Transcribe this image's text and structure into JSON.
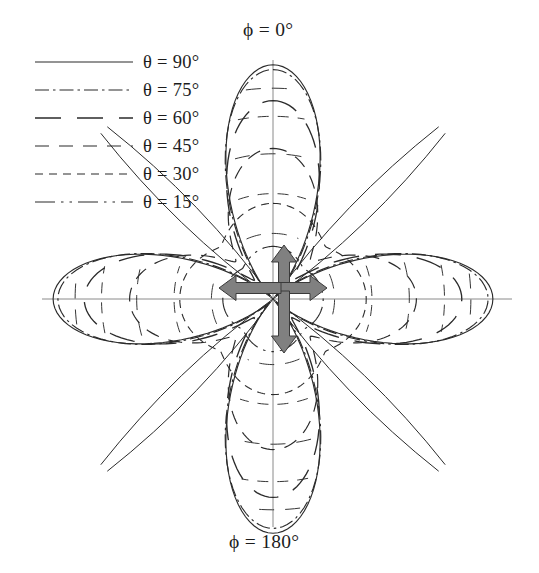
{
  "figure": {
    "kind": "polar-radiation-pattern",
    "width": 539,
    "height": 573,
    "background": "#ffffff",
    "ink_color": "#2b2b2b",
    "axis_color": "#8a8a8a",
    "arrow_fill": "#808080",
    "arrow_stroke": "#3a3a3a"
  },
  "axes": {
    "top_label": "ϕ = 0°",
    "bottom_label": "ϕ = 180°",
    "center": {
      "x": 273,
      "y": 299
    },
    "vertical_axis": {
      "y_top": 60,
      "y_bottom": 527
    },
    "horizontal_axis": {
      "x_left": 42,
      "x_right": 512
    }
  },
  "legend": {
    "position": "top-left",
    "entries": [
      {
        "label": "θ = 90°",
        "theta": 90,
        "style": "solid",
        "dash": "none",
        "width": 1.15
      },
      {
        "label": "θ = 75°",
        "theta": 75,
        "style": "dash-dot",
        "dash": "14,4,2.5,4",
        "width": 1.15
      },
      {
        "label": "θ = 60°",
        "theta": 60,
        "style": "long-dash",
        "dash": "26,16",
        "width": 1.35
      },
      {
        "label": "θ = 45°",
        "theta": 45,
        "style": "medium-dash",
        "dash": "14,10",
        "width": 1.2
      },
      {
        "label": "θ = 30°",
        "theta": 30,
        "style": "short-dash",
        "dash": "8,6",
        "width": 1.1
      },
      {
        "label": "θ = 15°",
        "theta": 15,
        "style": "dash-dot-dot",
        "dash": "20,6,2.5,6,2.5,6",
        "width": 1.15
      }
    ]
  },
  "chart_data": {
    "type": "line",
    "subtype": "polar",
    "title": "",
    "xlabel": "",
    "ylabel": "",
    "grid": false,
    "legend_position": "top-left",
    "angle_unit": "degrees",
    "angle_reference": "ϕ measured from vertical (ϕ = 0° up), increasing clockwise",
    "radial_unit": "normalized field magnitude (0 to 1)",
    "rlim": [
      0,
      1
    ],
    "scale_px_per_unit_vertical": 239,
    "scale_px_per_unit_horizontal": 239,
    "pattern_description": "Four-lobe clover pattern with nulls on the 45° diagonals; lobes shrink and nulls fill in as θ decreases",
    "lobe_peaks": {
      "phi_0_up": {
        "theta_90": 0.98,
        "theta_75": 0.96,
        "theta_60": 0.83,
        "theta_45": 0.63,
        "theta_30": 0.4,
        "theta_15": 0.22
      },
      "phi_90_right": {
        "theta_90": 0.92,
        "theta_75": 0.9,
        "theta_60": 0.79,
        "theta_45": 0.6,
        "theta_30": 0.39,
        "theta_15": 0.21
      }
    },
    "series": [
      {
        "name": "θ = 90°",
        "theta": 90,
        "null_depth": 0.02,
        "peak_up": 0.98,
        "peak_side": 0.92,
        "lobe_sharpness": 2.05,
        "phi": [
          0,
          15,
          30,
          45,
          60,
          75,
          90,
          105,
          120,
          135,
          150,
          165,
          180,
          195,
          210,
          225,
          240,
          255,
          270,
          285,
          300,
          315,
          330,
          345
        ],
        "r": [
          0.98,
          0.88,
          0.6,
          0.06,
          0.58,
          0.85,
          0.92,
          0.85,
          0.58,
          0.06,
          0.6,
          0.88,
          0.98,
          0.88,
          0.6,
          0.06,
          0.58,
          0.85,
          0.92,
          0.85,
          0.58,
          0.06,
          0.6,
          0.88
        ]
      },
      {
        "name": "θ = 75°",
        "theta": 75,
        "null_depth": 0.04,
        "peak_up": 0.96,
        "peak_side": 0.9,
        "lobe_sharpness": 1.95,
        "phi": [
          0,
          15,
          30,
          45,
          60,
          75,
          90,
          105,
          120,
          135,
          150,
          165,
          180,
          195,
          210,
          225,
          240,
          255,
          270,
          285,
          300,
          315,
          330,
          345
        ],
        "r": [
          0.96,
          0.86,
          0.59,
          0.09,
          0.57,
          0.83,
          0.9,
          0.83,
          0.57,
          0.09,
          0.59,
          0.86,
          0.96,
          0.86,
          0.59,
          0.09,
          0.57,
          0.83,
          0.9,
          0.83,
          0.57,
          0.09,
          0.59,
          0.86
        ]
      },
      {
        "name": "θ = 60°",
        "theta": 60,
        "null_depth": 0.11,
        "peak_up": 0.83,
        "peak_side": 0.79,
        "lobe_sharpness": 1.7,
        "phi": [
          0,
          15,
          30,
          45,
          60,
          75,
          90,
          105,
          120,
          135,
          150,
          165,
          180,
          195,
          210,
          225,
          240,
          255,
          270,
          285,
          300,
          315,
          330,
          345
        ],
        "r": [
          0.83,
          0.76,
          0.55,
          0.17,
          0.53,
          0.73,
          0.79,
          0.73,
          0.53,
          0.17,
          0.55,
          0.76,
          0.83,
          0.76,
          0.55,
          0.17,
          0.53,
          0.73,
          0.79,
          0.73,
          0.53,
          0.17,
          0.55,
          0.76
        ]
      },
      {
        "name": "θ = 45°",
        "theta": 45,
        "null_depth": 0.22,
        "peak_up": 0.63,
        "peak_side": 0.6,
        "lobe_sharpness": 1.4,
        "phi": [
          0,
          15,
          30,
          45,
          60,
          75,
          90,
          105,
          120,
          135,
          150,
          165,
          180,
          195,
          210,
          225,
          240,
          255,
          270,
          285,
          300,
          315,
          330,
          345
        ],
        "r": [
          0.63,
          0.6,
          0.48,
          0.28,
          0.47,
          0.57,
          0.6,
          0.57,
          0.47,
          0.28,
          0.48,
          0.6,
          0.63,
          0.6,
          0.48,
          0.28,
          0.47,
          0.57,
          0.6,
          0.57,
          0.47,
          0.28,
          0.48,
          0.6
        ]
      },
      {
        "name": "θ = 30°",
        "theta": 30,
        "null_depth": 0.31,
        "peak_up": 0.4,
        "peak_side": 0.39,
        "lobe_sharpness": 1.15,
        "phi": [
          0,
          15,
          30,
          45,
          60,
          75,
          90,
          105,
          120,
          135,
          150,
          165,
          180,
          195,
          210,
          225,
          240,
          255,
          270,
          285,
          300,
          315,
          330,
          345
        ],
        "r": [
          0.4,
          0.39,
          0.36,
          0.32,
          0.36,
          0.38,
          0.39,
          0.38,
          0.36,
          0.32,
          0.36,
          0.39,
          0.4,
          0.39,
          0.36,
          0.32,
          0.36,
          0.38,
          0.39,
          0.38,
          0.36,
          0.32,
          0.36,
          0.39
        ]
      },
      {
        "name": "θ = 15°",
        "theta": 15,
        "null_depth": 0.18,
        "peak_up": 0.22,
        "peak_side": 0.21,
        "lobe_sharpness": 1.1,
        "phi": [
          0,
          15,
          30,
          45,
          60,
          75,
          90,
          105,
          120,
          135,
          150,
          165,
          180,
          195,
          210,
          225,
          240,
          255,
          270,
          285,
          300,
          315,
          330,
          345
        ],
        "r": [
          0.22,
          0.21,
          0.2,
          0.18,
          0.2,
          0.21,
          0.21,
          0.21,
          0.2,
          0.18,
          0.2,
          0.21,
          0.22,
          0.21,
          0.2,
          0.18,
          0.2,
          0.21,
          0.21,
          0.21,
          0.2,
          0.18,
          0.2,
          0.21
        ]
      }
    ]
  },
  "antenna_symbol": {
    "description": "Four thick gray arrows in a rotationally symmetric pinwheel (crossed-element array) at the pattern origin",
    "arrows": [
      {
        "name": "arrow-up",
        "direction": "up",
        "offset_along": 8,
        "offset_across": 11
      },
      {
        "name": "arrow-right",
        "direction": "right",
        "offset_along": 8,
        "offset_across": -11
      },
      {
        "name": "arrow-down",
        "direction": "down",
        "offset_along": 8,
        "offset_across": -11
      },
      {
        "name": "arrow-left",
        "direction": "left",
        "offset_along": 8,
        "offset_across": 11
      }
    ],
    "shaft_thickness_px": 11,
    "arrow_length_px": 62,
    "head_width_px": 25,
    "head_length_px": 17
  }
}
